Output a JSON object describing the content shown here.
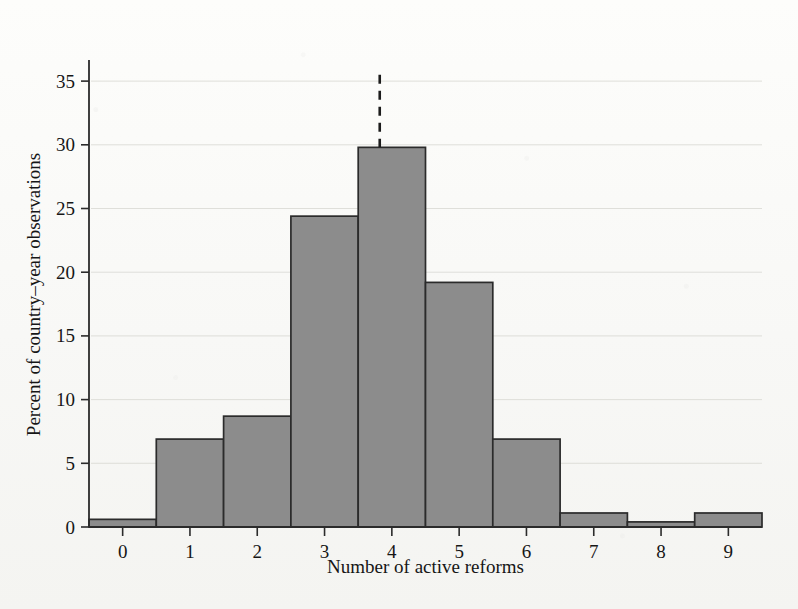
{
  "figure": {
    "background_color": "#fbfbf9",
    "bar_fill_color": "#8c8c8c",
    "bar_edge_color": "#2b2b2b",
    "axis_color": "#2b2b2b",
    "reference_line_color": "#1c1c1c"
  },
  "chart_data": {
    "type": "bar",
    "title": "",
    "xlabel": "Number of active reforms",
    "ylabel": "Percent of country–year observations",
    "categories": [
      "0",
      "1",
      "2",
      "3",
      "4",
      "5",
      "6",
      "7",
      "8",
      "9"
    ],
    "values": [
      0.6,
      6.9,
      8.7,
      24.4,
      29.8,
      19.2,
      6.9,
      1.1,
      0.4,
      1.1
    ],
    "xlim": [
      -0.5,
      9.5
    ],
    "ylim": [
      0,
      36.5
    ],
    "xticks": [
      "0",
      "1",
      "2",
      "3",
      "4",
      "5",
      "6",
      "7",
      "8",
      "9"
    ],
    "yticks": [
      "0",
      "5",
      "10",
      "15",
      "20",
      "25",
      "30",
      "35"
    ],
    "ytick_values": [
      0,
      5,
      10,
      15,
      20,
      25,
      30,
      35
    ],
    "grid": false,
    "legend": null,
    "annotations": [
      {
        "name": "mean-reference-line",
        "type": "vertical-dashed-line",
        "x_value": 3.82,
        "y_top": 35.5,
        "y_bottom": 29.8,
        "label": ""
      }
    ]
  }
}
